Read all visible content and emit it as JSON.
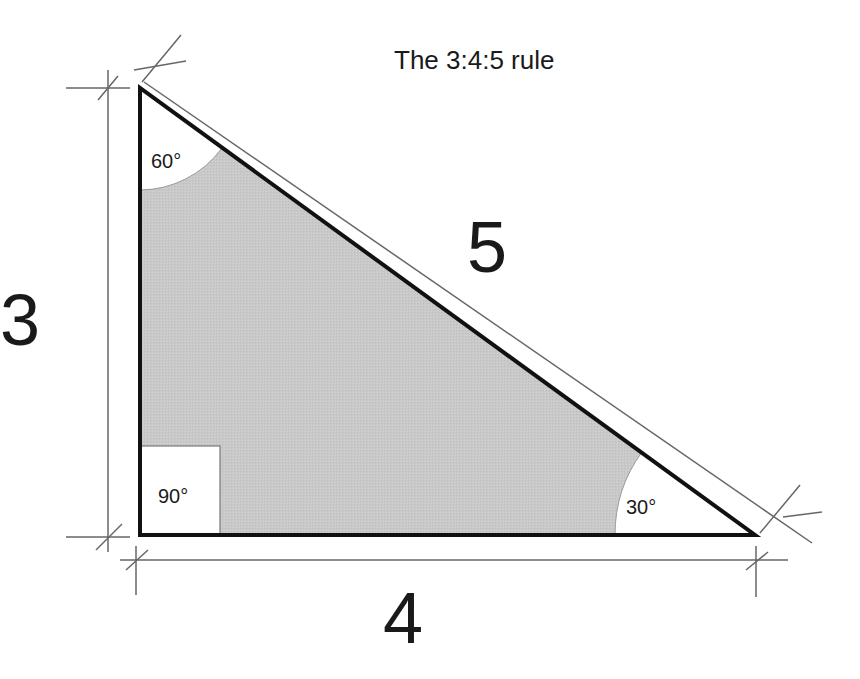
{
  "title": "The 3:4:5 rule",
  "sides": {
    "vertical": "3",
    "horizontal": "4",
    "hypotenuse": "5"
  },
  "angles": {
    "top": "60°",
    "right_angle": "90°",
    "bottom_right": "30°"
  },
  "colors": {
    "fill": "#c8c8c8",
    "stroke": "#111111",
    "dimension_line": "#666666",
    "background": "#ffffff"
  }
}
